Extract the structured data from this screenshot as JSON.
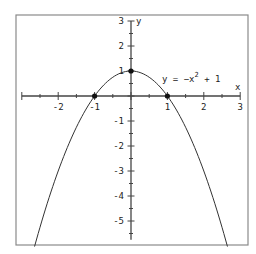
{
  "chart_data": {
    "type": "line",
    "title": "",
    "xlabel": "x",
    "ylabel": "y",
    "xlim": [
      -3,
      3
    ],
    "ylim": [
      -5.75,
      3
    ],
    "grid": false,
    "x_ticks": [
      -3,
      -2.5,
      -2,
      -1.5,
      -1,
      -0.5,
      0,
      0.5,
      1,
      1.5,
      2,
      2.5,
      3
    ],
    "x_tick_labels": [
      "-2",
      "-1",
      "1",
      "2",
      "3"
    ],
    "x_tick_label_values": [
      -2,
      -1,
      1,
      2,
      3
    ],
    "y_tick_labels": [
      "3",
      "2",
      "1",
      "-1",
      "-2",
      "-3",
      "-4",
      "-5"
    ],
    "y_tick_label_values": [
      3,
      2,
      1,
      -1,
      -2,
      -3,
      -4,
      -5
    ],
    "series": [
      {
        "name": "y = -x^2 + 1",
        "equation": "y = -x^2 + 1",
        "x": [
          -2.64,
          -2.5,
          -2,
          -1.5,
          -1,
          -0.5,
          0,
          0.5,
          1,
          1.5,
          2,
          2.5,
          2.64
        ],
        "y": [
          -5.97,
          -5.25,
          -3,
          -1.25,
          0,
          0.75,
          1,
          0.75,
          0,
          -1.25,
          -3,
          -5.25,
          -5.97
        ]
      }
    ],
    "points": [
      {
        "x": -1,
        "y": 0,
        "label": "x-intercept"
      },
      {
        "x": 0,
        "y": 1,
        "label": "vertex"
      },
      {
        "x": 1,
        "y": 0,
        "label": "x-intercept"
      }
    ],
    "annotations": [
      {
        "text": "y = -x",
        "superscript": "2",
        "suffix": " + 1",
        "x": 1.2,
        "y": 0.55
      }
    ],
    "colors": {
      "curve": "#333333",
      "axes": "#444444",
      "frame": "#888888"
    }
  },
  "labels": {
    "equation_main": "y = −x",
    "equation_sup": "2",
    "equation_tail": " + 1",
    "x_axis": "x",
    "y_axis": "y"
  }
}
